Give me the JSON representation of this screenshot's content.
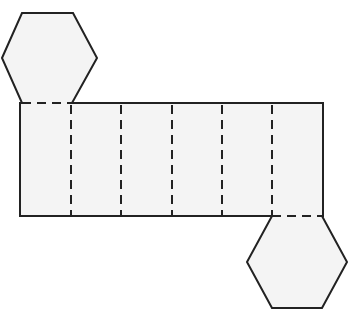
{
  "diagram": {
    "type": "net",
    "colors": {
      "fill": "#f4f4f4",
      "stroke": "#222222",
      "background": "#ffffff"
    },
    "top_hexagon": {
      "points": "2,58 22,13 73,13 97,58 72,103 22,103"
    },
    "bottom_hexagon": {
      "points": "272,216 322,216 347,262 322,308 272,308 247,262"
    },
    "rectangle": {
      "x": 20,
      "y": 103,
      "width": 303,
      "height": 113
    },
    "fold_lines_x": [
      71,
      121,
      172,
      222,
      272
    ],
    "face_count": {
      "rectangles": 6,
      "hexagons": 2
    }
  }
}
